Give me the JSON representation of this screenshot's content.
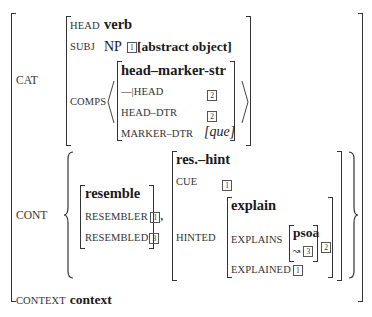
{
  "avm": {
    "cat": {
      "label": "CAT",
      "head": {
        "feature": "HEAD",
        "value": "verb"
      },
      "subj": {
        "feature": "SUBJ",
        "value_prefix": "NP",
        "tag": "1",
        "value": "[abstract object]"
      },
      "comps": {
        "feature": "COMPS",
        "type": "head–marker-str",
        "rows": [
          {
            "feature": "—|HEAD",
            "tag": "2"
          },
          {
            "feature": "HEAD–DTR",
            "tag": "2"
          },
          {
            "feature": "MARKER–DTR",
            "value": "[que]"
          }
        ]
      }
    },
    "cont": {
      "label": "CONT",
      "resemble": {
        "type": "resemble",
        "rows": [
          {
            "feature": "RESEMBLER",
            "tag": "1"
          },
          {
            "feature": "RESEMBLED",
            "tag": "3"
          }
        ]
      },
      "separator": ",",
      "res_hint": {
        "type": "res.–hint",
        "cue": {
          "feature": "CUE",
          "tag": "1"
        },
        "hinted": {
          "feature": "HINTED",
          "explain": {
            "type": "explain",
            "explains": {
              "feature": "EXPLAINS",
              "inner_type": "psoa",
              "inner_arrow": "↝",
              "inner_tag": "3",
              "outer_tag": "2"
            },
            "explained": {
              "feature": "EXPLAINED",
              "tag": "1"
            }
          }
        }
      }
    },
    "context": {
      "feature": "CONTEXT",
      "value": "context"
    }
  }
}
